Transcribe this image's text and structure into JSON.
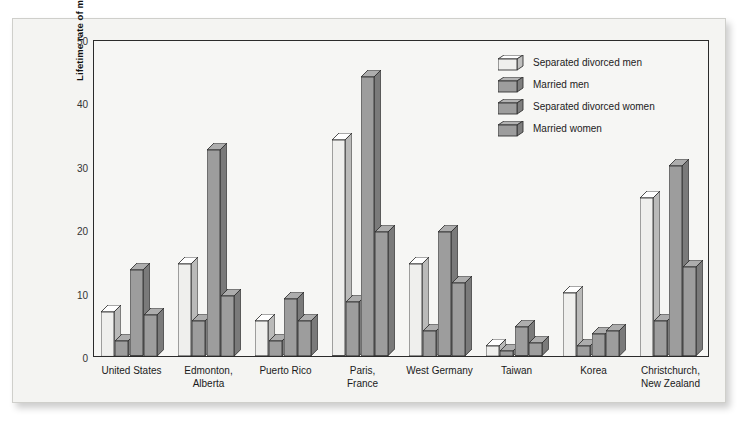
{
  "masthead": "PSYCHOLOGY\nTODAY REVIEW",
  "chart_data": {
    "type": "bar",
    "title": "",
    "xlabel": "",
    "ylabel": "Lifetime rate of major depression per 100 population",
    "ylim": [
      0,
      50
    ],
    "yticks": [
      0,
      10,
      20,
      30,
      40,
      50
    ],
    "grid": false,
    "legend_position": "top-right",
    "categories": [
      "United States",
      "Edmonton,\nAlberta",
      "Puerto Rico",
      "Paris,\nFrance",
      "West Germany",
      "Taiwan",
      "Korea",
      "Christchurch,\nNew Zealand"
    ],
    "series": [
      {
        "name": "Separated divorced men",
        "color": "#efefed",
        "values": [
          7.0,
          14.5,
          5.5,
          34.0,
          14.5,
          1.6,
          10.0,
          25.0
        ]
      },
      {
        "name": "Married men",
        "color": "#9d9d9d",
        "values": [
          2.4,
          5.5,
          2.4,
          8.5,
          4.0,
          0.8,
          1.6,
          5.5
        ]
      },
      {
        "name": "Separated divorced women",
        "color": "#9d9d9d",
        "values": [
          13.5,
          32.5,
          9.0,
          44.0,
          19.5,
          4.5,
          3.5,
          30.0
        ]
      },
      {
        "name": "Married women",
        "color": "#9d9d9d",
        "values": [
          6.5,
          9.5,
          5.5,
          19.5,
          11.5,
          2.0,
          4.0,
          14.0
        ]
      }
    ]
  }
}
